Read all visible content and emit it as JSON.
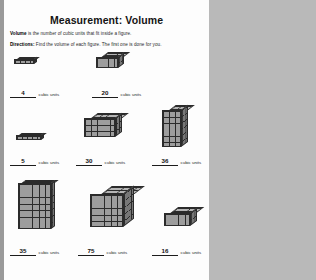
{
  "page": {
    "title": "Measurement: Volume",
    "definition_label": "Volume",
    "definition_text": " is the number of cubic units that fit inside a figure.",
    "directions_label": "Directions:",
    "directions_text": " Find the volume of each figure. The first one is done for you.",
    "units_label": "cubic units",
    "ink_color": "#2b2b2b",
    "paper_color": "#fdfdfd"
  },
  "figures": [
    {
      "id": "figure-1",
      "answer": "4",
      "units": "cubic units",
      "prefilled": true,
      "width_cubes": 4,
      "height_cubes": 1,
      "depth_cubes": 1
    },
    {
      "id": "figure-2",
      "answer": "20",
      "units": "cubic units",
      "prefilled": false,
      "width_cubes": 4,
      "height_cubes": 2,
      "depth_cubes": 2
    },
    {
      "id": "figure-3",
      "answer": "5",
      "units": "cubic units",
      "prefilled": false,
      "width_cubes": 5,
      "height_cubes": 1,
      "depth_cubes": 1
    },
    {
      "id": "figure-4",
      "answer": "30",
      "units": "cubic units",
      "prefilled": false,
      "width_cubes": 5,
      "height_cubes": 3,
      "depth_cubes": 2
    },
    {
      "id": "figure-5",
      "answer": "36",
      "units": "cubic units",
      "prefilled": false,
      "width_cubes": 3,
      "height_cubes": 6,
      "depth_cubes": 2
    },
    {
      "id": "figure-6",
      "answer": "35",
      "units": "cubic units",
      "prefilled": false,
      "width_cubes": 5,
      "height_cubes": 7,
      "depth_cubes": 1
    },
    {
      "id": "figure-7",
      "answer": "75",
      "units": "cubic units",
      "prefilled": false,
      "width_cubes": 5,
      "height_cubes": 5,
      "depth_cubes": 3
    },
    {
      "id": "figure-8",
      "answer": "16",
      "units": "cubic units",
      "prefilled": false,
      "width_cubes": 4,
      "height_cubes": 2,
      "depth_cubes": 2
    }
  ]
}
